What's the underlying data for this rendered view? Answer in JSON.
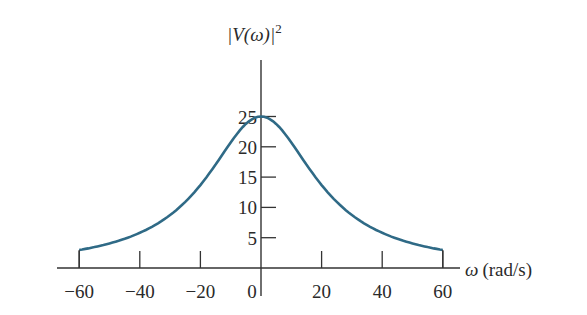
{
  "chart_data": {
    "type": "line",
    "title": "",
    "xlabel": "ω (rad/s)",
    "ylabel": "|V(ω)|²",
    "xlim": [
      -60,
      60
    ],
    "ylim": [
      0,
      25
    ],
    "x_ticks": [
      -60,
      -40,
      -20,
      0,
      20,
      40,
      60
    ],
    "x_tick_labels": [
      "−60",
      "−40",
      "−20",
      "0",
      "20",
      "40",
      "60"
    ],
    "y_ticks": [
      5,
      10,
      15,
      20,
      25
    ],
    "y_tick_labels": [
      "5",
      "10",
      "15",
      "20",
      "25"
    ],
    "grid": false,
    "legend": null,
    "series": [
      {
        "name": "|V(ω)|²",
        "color": "#2f6a86",
        "x": [
          -60,
          -50,
          -40,
          -30,
          -20,
          -10,
          0,
          10,
          20,
          30,
          40,
          50,
          60
        ],
        "values": [
          2.9,
          4.0,
          5.8,
          8.8,
          13.7,
          20.7,
          25.0,
          20.7,
          13.7,
          8.8,
          5.8,
          4.0,
          2.9
        ]
      }
    ]
  },
  "labels": {
    "ylabel_main": "|V(ω)|",
    "ylabel_sup": "2",
    "xlabel_symbol": "ω",
    "xlabel_units": "(rad/s)"
  }
}
